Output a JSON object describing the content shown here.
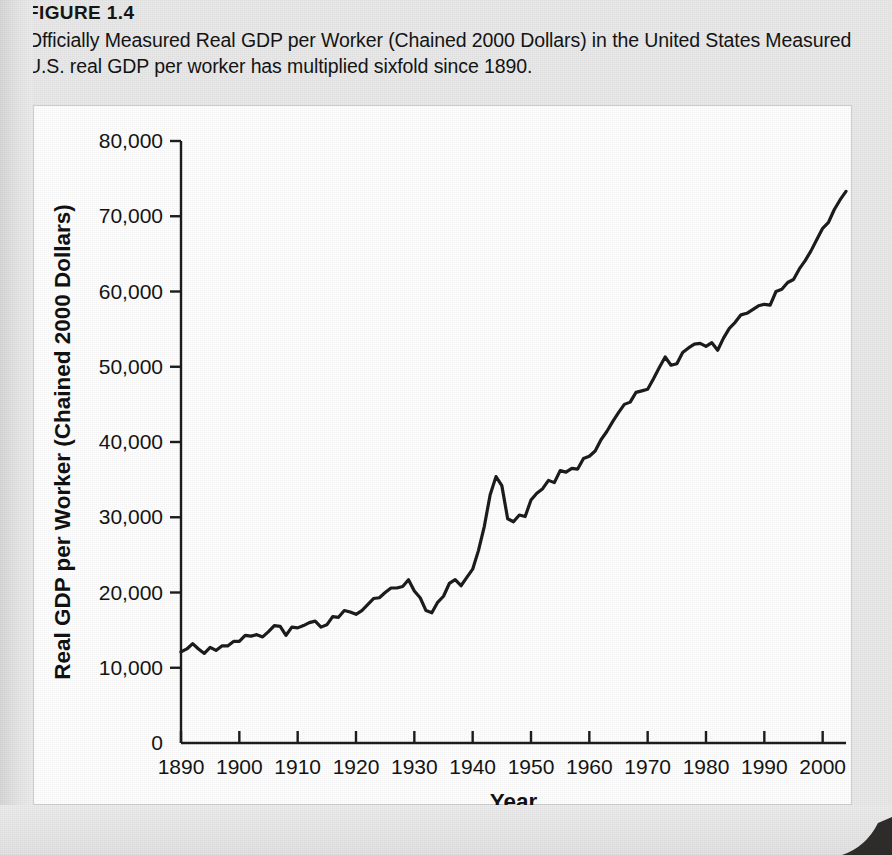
{
  "figure": {
    "number_label": "FIGURE 1.4",
    "caption": "Officially Measured Real GDP per Worker (Chained 2000 Dollars) in the United States Measured U.S. real GDP per worker has multiplied sixfold since 1890."
  },
  "chart_data": {
    "type": "line",
    "title": "Officially Measured Real GDP per Worker (Chained 2000 Dollars) in the United States",
    "xlabel": "Year",
    "ylabel": "Real GDP per Worker (Chained 2000 Dollars)",
    "xlim": [
      1890,
      2004
    ],
    "ylim": [
      0,
      80000
    ],
    "xticks": [
      1890,
      1900,
      1910,
      1920,
      1930,
      1940,
      1950,
      1960,
      1970,
      1980,
      1990,
      2000
    ],
    "xtick_labels": [
      "1890",
      "1900",
      "1910",
      "1920",
      "1930",
      "1940",
      "1950",
      "1960",
      "1970",
      "1980",
      "1990",
      "2000"
    ],
    "yticks": [
      0,
      10000,
      20000,
      30000,
      40000,
      50000,
      60000,
      70000,
      80000
    ],
    "ytick_labels": [
      "0",
      "10,000",
      "20,000",
      "30,000",
      "40,000",
      "50,000",
      "60,000",
      "70,000",
      "80,000"
    ],
    "grid": false,
    "legend": false,
    "line_color": "#1c1c1c",
    "line_width": 3.2,
    "series": [
      {
        "name": "Real GDP per worker",
        "x": [
          1890,
          1891,
          1892,
          1893,
          1894,
          1895,
          1896,
          1897,
          1898,
          1899,
          1900,
          1901,
          1902,
          1903,
          1904,
          1905,
          1906,
          1907,
          1908,
          1909,
          1910,
          1911,
          1912,
          1913,
          1914,
          1915,
          1916,
          1917,
          1918,
          1919,
          1920,
          1921,
          1922,
          1923,
          1924,
          1925,
          1926,
          1927,
          1928,
          1929,
          1930,
          1931,
          1932,
          1933,
          1934,
          1935,
          1936,
          1937,
          1938,
          1939,
          1940,
          1941,
          1942,
          1943,
          1944,
          1945,
          1946,
          1947,
          1948,
          1949,
          1950,
          1951,
          1952,
          1953,
          1954,
          1955,
          1956,
          1957,
          1958,
          1959,
          1960,
          1961,
          1962,
          1963,
          1964,
          1965,
          1966,
          1967,
          1968,
          1969,
          1970,
          1971,
          1972,
          1973,
          1974,
          1975,
          1976,
          1977,
          1978,
          1979,
          1980,
          1981,
          1982,
          1983,
          1984,
          1985,
          1986,
          1987,
          1988,
          1989,
          1990,
          1991,
          1992,
          1993,
          1994,
          1995,
          1996,
          1997,
          1998,
          1999,
          2000,
          2001,
          2002,
          2003,
          2004
        ],
        "values": [
          12100,
          12500,
          13200,
          12500,
          11900,
          12700,
          12300,
          12900,
          12900,
          13500,
          13500,
          14300,
          14200,
          14400,
          14100,
          14800,
          15600,
          15500,
          14300,
          15400,
          15300,
          15600,
          16000,
          16200,
          15400,
          15700,
          16800,
          16700,
          17600,
          17400,
          17100,
          17600,
          18400,
          19200,
          19300,
          20000,
          20600,
          20600,
          20800,
          21700,
          20200,
          19300,
          17600,
          17300,
          18700,
          19500,
          21200,
          21700,
          20900,
          22000,
          23100,
          25600,
          28800,
          33000,
          35400,
          34200,
          29800,
          29400,
          30300,
          30100,
          32300,
          33200,
          33800,
          34900,
          34600,
          36200,
          36000,
          36500,
          36400,
          37800,
          38100,
          38800,
          40300,
          41400,
          42700,
          43900,
          45000,
          45300,
          46600,
          46800,
          47000,
          48400,
          49900,
          51300,
          50200,
          50400,
          51900,
          52500,
          53000,
          53100,
          52700,
          53200,
          52200,
          53800,
          55100,
          55900,
          56900,
          57100,
          57600,
          58100,
          58300,
          58200,
          60000,
          60300,
          61200,
          61600,
          63000,
          64100,
          65400,
          66900,
          68400,
          69200,
          70900,
          72200,
          73300
        ]
      }
    ]
  }
}
